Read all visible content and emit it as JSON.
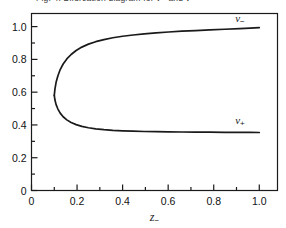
{
  "figure": {
    "caption": "Fig. 4. Bifurcation diagram for v− and v+",
    "background_color": "#ffffff",
    "line_color": "#1a1a1a",
    "axis_color": "#1a1a1a"
  },
  "chart_data": {
    "type": "line",
    "title": "",
    "xlabel": "z−",
    "ylabel": "",
    "xlim": [
      0,
      1.08
    ],
    "ylim": [
      0,
      1.08
    ],
    "grid": false,
    "legend_position": "inline-right",
    "x_ticks_major": [
      0,
      0.2,
      0.4,
      0.6,
      0.8,
      1.0
    ],
    "x_tick_labels": [
      "0",
      "0.2",
      "0.4",
      "0.6",
      "0.8",
      "1.0"
    ],
    "x_ticks_minor": [
      0.1,
      0.3,
      0.5,
      0.7,
      0.9
    ],
    "y_ticks_major": [
      0,
      0.2,
      0.4,
      0.6,
      0.8,
      1.0
    ],
    "y_tick_labels": [
      "0",
      "0.2",
      "0.4",
      "0.6",
      "0.8",
      "1.0"
    ],
    "y_ticks_minor": [
      0.1,
      0.3,
      0.5,
      0.7,
      0.9
    ],
    "turning_point": {
      "x": 0.1,
      "y": 0.58
    },
    "annotations": [
      {
        "text": "v−",
        "x": 0.915,
        "y": 1.045
      },
      {
        "text": "v+",
        "x": 0.915,
        "y": 0.425
      }
    ],
    "series": [
      {
        "name": "v−",
        "label": "v−",
        "branch": "upper",
        "x": [
          0.1,
          0.103,
          0.108,
          0.116,
          0.126,
          0.139,
          0.155,
          0.174,
          0.196,
          0.221,
          0.25,
          0.282,
          0.318,
          0.357,
          0.4,
          0.446,
          0.495,
          0.547,
          0.602,
          0.66,
          0.72,
          0.783,
          0.848,
          0.915,
          0.96,
          1.0
        ],
        "y": [
          0.58,
          0.62,
          0.66,
          0.7,
          0.738,
          0.772,
          0.803,
          0.83,
          0.854,
          0.875,
          0.893,
          0.908,
          0.921,
          0.932,
          0.941,
          0.949,
          0.956,
          0.962,
          0.967,
          0.972,
          0.976,
          0.98,
          0.984,
          0.988,
          0.991,
          0.994
        ]
      },
      {
        "name": "v+",
        "label": "v+",
        "branch": "lower",
        "x": [
          0.1,
          0.103,
          0.108,
          0.116,
          0.126,
          0.139,
          0.155,
          0.174,
          0.196,
          0.221,
          0.25,
          0.282,
          0.318,
          0.357,
          0.4,
          0.446,
          0.495,
          0.547,
          0.602,
          0.66,
          0.72,
          0.783,
          0.848,
          0.915,
          0.96,
          1.0
        ],
        "y": [
          0.58,
          0.552,
          0.524,
          0.497,
          0.472,
          0.45,
          0.431,
          0.415,
          0.402,
          0.391,
          0.383,
          0.376,
          0.371,
          0.367,
          0.364,
          0.362,
          0.36,
          0.359,
          0.358,
          0.357,
          0.356,
          0.356,
          0.355,
          0.355,
          0.355,
          0.354
        ]
      }
    ]
  }
}
